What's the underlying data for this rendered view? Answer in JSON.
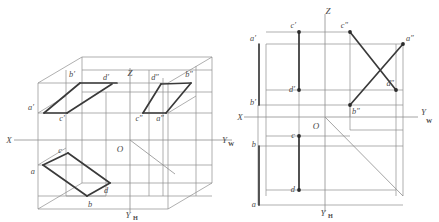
{
  "figure": {
    "background_color": "#ffffff",
    "line_color_thin": "#8d8d8d",
    "line_color_thick": "#3a3a3a",
    "dot_color": "#2b2b2b",
    "label_color": "#4a4a4a"
  },
  "left_diagram": {
    "name": "spatial-projection-box",
    "origin_label": "O",
    "axes": [
      {
        "name": "x-axis",
        "label": "X",
        "sub": ""
      },
      {
        "name": "z-axis",
        "label": "Z",
        "sub": ""
      },
      {
        "name": "yw-axis",
        "label": "Y",
        "sub": "W"
      },
      {
        "name": "yh-axis",
        "label": "Y",
        "sub": "H"
      }
    ],
    "point_labels": [
      {
        "name": "a-prime",
        "label": "a′",
        "x": 34,
        "y": 110
      },
      {
        "name": "b-prime",
        "label": "b′",
        "x": 72,
        "y": 77
      },
      {
        "name": "c-prime",
        "label": "c′",
        "x": 58,
        "y": 117
      },
      {
        "name": "d-prime",
        "label": "d′",
        "x": 106,
        "y": 87
      },
      {
        "name": "a-double-prime",
        "label": "a″",
        "x": 155,
        "y": 117
      },
      {
        "name": "b-double-prime",
        "label": "b″",
        "x": 182,
        "y": 77
      },
      {
        "name": "c-double-prime",
        "label": "c″",
        "x": 134,
        "y": 117
      },
      {
        "name": "d-double-prime",
        "label": "d″",
        "x": 150,
        "y": 87
      },
      {
        "name": "a-point",
        "label": "a",
        "x": 34,
        "y": 172
      },
      {
        "name": "b-point",
        "label": "b",
        "x": 92,
        "y": 202
      },
      {
        "name": "c-point",
        "label": "c",
        "x": 62,
        "y": 155
      },
      {
        "name": "d-point",
        "label": "d",
        "x": 103,
        "y": 190
      }
    ]
  },
  "right_diagram": {
    "name": "three-view-projection-drawing",
    "origin_label": "O",
    "axes": [
      {
        "name": "x-axis",
        "label": "X",
        "sub": ""
      },
      {
        "name": "z-axis",
        "label": "Z",
        "sub": ""
      },
      {
        "name": "yw-axis",
        "label": "Y",
        "sub": "W"
      },
      {
        "name": "yh-axis",
        "label": "Y",
        "sub": "H"
      }
    ],
    "point_labels": [
      {
        "name": "a-prime",
        "label": "a′",
        "x": 259,
        "y": 37
      },
      {
        "name": "c-prime",
        "label": "c′",
        "x": 293,
        "y": 26
      },
      {
        "name": "c-double-prime",
        "label": "c″",
        "x": 344,
        "y": 26
      },
      {
        "name": "a-double-prime",
        "label": "a″",
        "x": 402,
        "y": 37
      },
      {
        "name": "d-prime",
        "label": "d′",
        "x": 291,
        "y": 84
      },
      {
        "name": "d-double-prime",
        "label": "d″",
        "x": 393,
        "y": 84
      },
      {
        "name": "b-prime",
        "label": "b′",
        "x": 259,
        "y": 99
      },
      {
        "name": "b-double-prime",
        "label": "b″",
        "x": 351,
        "y": 105
      },
      {
        "name": "c-point",
        "label": "c",
        "x": 293,
        "y": 133
      },
      {
        "name": "b-point",
        "label": "b",
        "x": 259,
        "y": 142
      },
      {
        "name": "d-point",
        "label": "d",
        "x": 293,
        "y": 184
      },
      {
        "name": "a-point",
        "label": "a",
        "x": 259,
        "y": 203
      }
    ],
    "node_dots": [
      {
        "name": "dot-c-prime"
      },
      {
        "name": "dot-c-double-prime"
      },
      {
        "name": "dot-a-double-prime"
      },
      {
        "name": "dot-d-prime"
      },
      {
        "name": "dot-d-double-prime"
      },
      {
        "name": "dot-b-double-prime"
      },
      {
        "name": "dot-c-point"
      },
      {
        "name": "dot-d-point"
      }
    ]
  }
}
